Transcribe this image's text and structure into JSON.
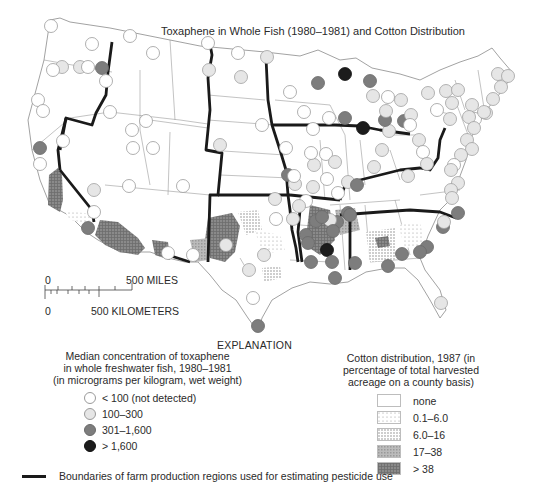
{
  "title": "Toxaphene in Whole Fish (1980–1981) and Cotton Distribution",
  "scale_bar": {
    "miles_zero": "0",
    "miles_label": "500 MILES",
    "km_zero": "0",
    "km_label": "500 KILOMETERS"
  },
  "explanation_label": "EXPLANATION",
  "fish_legend": {
    "heading_line1": "Median concentration of toxaphene",
    "heading_line2": "in whole freshwater fish, 1980–1981",
    "heading_line3": "(in micrograms per kilogram, wet weight)",
    "items": [
      {
        "label": "< 100 (not detected)",
        "color": "#ffffff"
      },
      {
        "label": "100–300",
        "color": "#e6e6e6"
      },
      {
        "label": "301–1,600",
        "color": "#7d7d7d"
      },
      {
        "label": "> 1,600",
        "color": "#1c1c1c"
      }
    ]
  },
  "cotton_legend": {
    "heading_line1": "Cotton distribution, 1987 (in",
    "heading_line2": "percentage of total harvested",
    "heading_line3": "acreage on a county basis)",
    "items": [
      {
        "label": "none",
        "pattern": "none"
      },
      {
        "label": "0.1–6.0",
        "pattern": "sparse-dots"
      },
      {
        "label": "6.0–16",
        "pattern": "dense-dots"
      },
      {
        "label": "17–38",
        "pattern": "light-grid"
      },
      {
        "label": "> 38",
        "pattern": "dark-grid"
      }
    ]
  },
  "boundary_legend": {
    "label": "Boundaries of farm production regions used for estimating pesticide use"
  },
  "chart_data": {
    "type": "map",
    "title": "Toxaphene in Whole Fish (1980–1981) and Cotton Distribution",
    "region": "Conterminous United States",
    "layers": [
      {
        "name": "Median toxaphene concentration in whole freshwater fish, 1980–1981 (µg/kg wet weight)",
        "type": "graduated-symbols",
        "classes": [
          "< 100 (not detected)",
          "100–300",
          "301–1,600",
          "> 1,600"
        ]
      },
      {
        "name": "Cotton distribution, 1987 (% of total harvested acreage, county basis)",
        "type": "choropleth",
        "classes": [
          "none",
          "0.1–6.0",
          "6.0–16",
          "17–38",
          "> 38"
        ]
      },
      {
        "name": "Boundaries of farm production regions used for estimating pesticide use",
        "type": "line"
      }
    ]
  },
  "map": {
    "sites": [
      {
        "x": 62,
        "y": 67,
        "c": 1
      },
      {
        "x": 80,
        "y": 67,
        "c": 1
      },
      {
        "x": 88,
        "y": 67,
        "c": 0
      },
      {
        "x": 102,
        "y": 68,
        "c": 2
      },
      {
        "x": 53,
        "y": 70,
        "c": 0
      },
      {
        "x": 92,
        "y": 44,
        "c": 0
      },
      {
        "x": 106,
        "y": 81,
        "c": 0
      },
      {
        "x": 38,
        "y": 100,
        "c": 0
      },
      {
        "x": 43,
        "y": 111,
        "c": 0
      },
      {
        "x": 110,
        "y": 112,
        "c": 0
      },
      {
        "x": 63,
        "y": 141,
        "c": 0
      },
      {
        "x": 40,
        "y": 148,
        "c": 2
      },
      {
        "x": 130,
        "y": 36,
        "c": 0
      },
      {
        "x": 153,
        "y": 53,
        "c": 0
      },
      {
        "x": 51,
        "y": 26,
        "c": 0
      },
      {
        "x": 132,
        "y": 130,
        "c": 0
      },
      {
        "x": 146,
        "y": 121,
        "c": 0
      },
      {
        "x": 133,
        "y": 148,
        "c": 0
      },
      {
        "x": 153,
        "y": 148,
        "c": 0
      },
      {
        "x": 129,
        "y": 186,
        "c": 0
      },
      {
        "x": 183,
        "y": 186,
        "c": 0
      },
      {
        "x": 94,
        "y": 190,
        "c": 1
      },
      {
        "x": 94,
        "y": 212,
        "c": 0
      },
      {
        "x": 88,
        "y": 228,
        "c": 2
      },
      {
        "x": 40,
        "y": 164,
        "c": 0
      },
      {
        "x": 209,
        "y": 70,
        "c": 1
      },
      {
        "x": 238,
        "y": 53,
        "c": 0
      },
      {
        "x": 208,
        "y": 43,
        "c": 0
      },
      {
        "x": 267,
        "y": 57,
        "c": 1
      },
      {
        "x": 241,
        "y": 77,
        "c": 1
      },
      {
        "x": 290,
        "y": 92,
        "c": 0
      },
      {
        "x": 220,
        "y": 145,
        "c": 1
      },
      {
        "x": 262,
        "y": 125,
        "c": 0
      },
      {
        "x": 264,
        "y": 255,
        "c": 1
      },
      {
        "x": 318,
        "y": 83,
        "c": 2
      },
      {
        "x": 345,
        "y": 74,
        "c": 3
      },
      {
        "x": 370,
        "y": 81,
        "c": 2
      },
      {
        "x": 388,
        "y": 97,
        "c": 0
      },
      {
        "x": 304,
        "y": 112,
        "c": 0
      },
      {
        "x": 345,
        "y": 118,
        "c": 2
      },
      {
        "x": 363,
        "y": 128,
        "c": 3
      },
      {
        "x": 326,
        "y": 154,
        "c": 0
      },
      {
        "x": 335,
        "y": 162,
        "c": 1
      },
      {
        "x": 314,
        "y": 165,
        "c": 1
      },
      {
        "x": 286,
        "y": 148,
        "c": 0
      },
      {
        "x": 311,
        "y": 153,
        "c": 0
      },
      {
        "x": 313,
        "y": 129,
        "c": 0
      },
      {
        "x": 329,
        "y": 118,
        "c": 0
      },
      {
        "x": 288,
        "y": 175,
        "c": 2
      },
      {
        "x": 295,
        "y": 184,
        "c": 1
      },
      {
        "x": 294,
        "y": 176,
        "c": 0
      },
      {
        "x": 313,
        "y": 187,
        "c": 1
      },
      {
        "x": 327,
        "y": 179,
        "c": 0
      },
      {
        "x": 348,
        "y": 182,
        "c": 1
      },
      {
        "x": 374,
        "y": 167,
        "c": 1
      },
      {
        "x": 382,
        "y": 150,
        "c": 1
      },
      {
        "x": 389,
        "y": 131,
        "c": 1
      },
      {
        "x": 385,
        "y": 120,
        "c": 2
      },
      {
        "x": 401,
        "y": 100,
        "c": 1
      },
      {
        "x": 404,
        "y": 121,
        "c": 2
      },
      {
        "x": 373,
        "y": 96,
        "c": 1
      },
      {
        "x": 386,
        "y": 111,
        "c": 1
      },
      {
        "x": 411,
        "y": 115,
        "c": 1
      },
      {
        "x": 410,
        "y": 125,
        "c": 0
      },
      {
        "x": 419,
        "y": 140,
        "c": 1
      },
      {
        "x": 423,
        "y": 152,
        "c": 0
      },
      {
        "x": 427,
        "y": 164,
        "c": 1
      },
      {
        "x": 408,
        "y": 176,
        "c": 1
      },
      {
        "x": 428,
        "y": 93,
        "c": 1
      },
      {
        "x": 446,
        "y": 91,
        "c": 1
      },
      {
        "x": 452,
        "y": 103,
        "c": 1
      },
      {
        "x": 437,
        "y": 110,
        "c": 0
      },
      {
        "x": 458,
        "y": 90,
        "c": 1
      },
      {
        "x": 472,
        "y": 105,
        "c": 1
      },
      {
        "x": 486,
        "y": 113,
        "c": 1
      },
      {
        "x": 475,
        "y": 119,
        "c": 0
      },
      {
        "x": 450,
        "y": 119,
        "c": 1
      },
      {
        "x": 498,
        "y": 74,
        "c": 1
      },
      {
        "x": 508,
        "y": 76,
        "c": 1
      },
      {
        "x": 501,
        "y": 87,
        "c": 1
      },
      {
        "x": 493,
        "y": 99,
        "c": 1
      },
      {
        "x": 484,
        "y": 112,
        "c": 1
      },
      {
        "x": 469,
        "y": 117,
        "c": 1
      },
      {
        "x": 474,
        "y": 128,
        "c": 1
      },
      {
        "x": 467,
        "y": 140,
        "c": 1
      },
      {
        "x": 472,
        "y": 149,
        "c": 1
      },
      {
        "x": 461,
        "y": 155,
        "c": 1
      },
      {
        "x": 454,
        "y": 165,
        "c": 0
      },
      {
        "x": 451,
        "y": 170,
        "c": 1
      },
      {
        "x": 458,
        "y": 183,
        "c": 1
      },
      {
        "x": 451,
        "y": 190,
        "c": 1
      },
      {
        "x": 452,
        "y": 198,
        "c": 1
      },
      {
        "x": 458,
        "y": 213,
        "c": 2
      },
      {
        "x": 443,
        "y": 227,
        "c": 2
      },
      {
        "x": 444,
        "y": 222,
        "c": 1
      },
      {
        "x": 427,
        "y": 247,
        "c": 2
      },
      {
        "x": 420,
        "y": 252,
        "c": 2
      },
      {
        "x": 357,
        "y": 185,
        "c": 2
      },
      {
        "x": 338,
        "y": 193,
        "c": 0
      },
      {
        "x": 337,
        "y": 222,
        "c": 2
      },
      {
        "x": 306,
        "y": 235,
        "c": 2
      },
      {
        "x": 330,
        "y": 220,
        "c": 1
      },
      {
        "x": 333,
        "y": 231,
        "c": 2
      },
      {
        "x": 348,
        "y": 213,
        "c": 2
      },
      {
        "x": 316,
        "y": 221,
        "c": 2
      },
      {
        "x": 322,
        "y": 217,
        "c": 2
      },
      {
        "x": 327,
        "y": 250,
        "c": 3
      },
      {
        "x": 350,
        "y": 215,
        "c": 2
      },
      {
        "x": 311,
        "y": 262,
        "c": 2
      },
      {
        "x": 308,
        "y": 243,
        "c": 2
      },
      {
        "x": 332,
        "y": 262,
        "c": 2
      },
      {
        "x": 335,
        "y": 278,
        "c": 2
      },
      {
        "x": 355,
        "y": 263,
        "c": 2
      },
      {
        "x": 388,
        "y": 266,
        "c": 2
      },
      {
        "x": 402,
        "y": 254,
        "c": 2
      },
      {
        "x": 441,
        "y": 303,
        "c": 1
      },
      {
        "x": 293,
        "y": 219,
        "c": 1
      },
      {
        "x": 306,
        "y": 201,
        "c": 0
      },
      {
        "x": 276,
        "y": 219,
        "c": 0
      },
      {
        "x": 275,
        "y": 199,
        "c": 1
      },
      {
        "x": 299,
        "y": 206,
        "c": 1
      },
      {
        "x": 249,
        "y": 270,
        "c": 1
      },
      {
        "x": 253,
        "y": 298,
        "c": 0
      },
      {
        "x": 258,
        "y": 326,
        "c": 2
      },
      {
        "x": 226,
        "y": 245,
        "c": 1
      },
      {
        "x": 193,
        "y": 255,
        "c": 0
      },
      {
        "x": 168,
        "y": 253,
        "c": 0
      }
    ],
    "cotton_areas": [
      {
        "points": "49,175 58,168 62,175 63,200 60,212 48,205",
        "cls": 4
      },
      {
        "points": "100,220 118,222 128,230 138,238 145,248 138,255 120,252 105,245 95,235",
        "cls": 4
      },
      {
        "points": "64,210 90,214 95,225 85,223 70,220",
        "cls": 1
      },
      {
        "points": "152,240 168,242 170,260 155,255",
        "cls": 4
      },
      {
        "points": "208,218 232,213 240,226 235,252 225,262 210,258 205,240",
        "cls": 4
      },
      {
        "points": "190,240 210,238 208,260 195,262",
        "cls": 3
      },
      {
        "points": "238,212 258,210 262,230 246,235",
        "cls": 2
      },
      {
        "points": "255,230 280,235 285,250 262,255",
        "cls": 1
      },
      {
        "points": "262,268 280,266 282,278 264,282",
        "cls": 2
      },
      {
        "points": "310,205 330,210 335,240 320,255 305,245",
        "cls": 4
      },
      {
        "points": "335,210 355,208 360,230 340,235",
        "cls": 3
      },
      {
        "points": "366,232 395,228 395,260 370,262",
        "cls": 2
      },
      {
        "points": "398,225 420,222 425,245 405,248",
        "cls": 1
      },
      {
        "points": "375,238 388,236 390,246 378,248",
        "cls": 4
      }
    ]
  }
}
